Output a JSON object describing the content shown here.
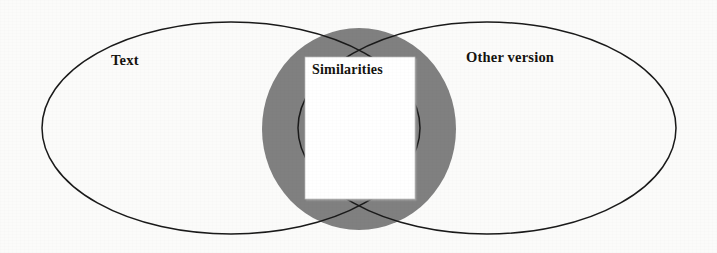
{
  "diagram": {
    "type": "venn",
    "background_color": "#fbfbfa",
    "sets": [
      {
        "id": "left",
        "label": "Text",
        "shape": "ellipse",
        "fill": "none",
        "stroke": "#1a1a1a"
      },
      {
        "id": "right",
        "label": "Other version",
        "shape": "ellipse",
        "fill": "none",
        "stroke": "#1a1a1a"
      }
    ],
    "intersection": {
      "label": "Similarities",
      "shape": "circle",
      "fill": "#808080",
      "note_card_fill": "#ffffff"
    },
    "colors": {
      "stroke": "#1a1a1a",
      "intersection_gray": "#808080",
      "card_white": "#ffffff",
      "text": "#15130f"
    }
  }
}
